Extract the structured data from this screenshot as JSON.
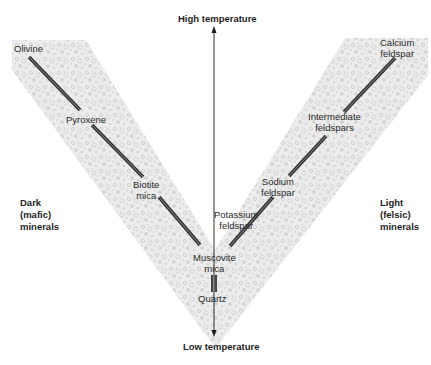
{
  "diagram": {
    "title_top": "High temperature",
    "title_bottom": "Low temperature",
    "left_group": {
      "line1": "Dark",
      "line2": "(mafic)",
      "line3": "minerals"
    },
    "right_group": {
      "line1": "Light",
      "line2": "(felsic)",
      "line3": "minerals"
    },
    "left_series": [
      {
        "label": "Olivine"
      },
      {
        "label": "Pyroxene"
      },
      {
        "label_line1": "Biotite",
        "label_line2": "mica"
      }
    ],
    "right_series": [
      {
        "label_line1": "Calcium",
        "label_line2": "feldspar"
      },
      {
        "label_line1": "Intermediate",
        "label_line2": "feldspars"
      },
      {
        "label_line1": "Sodium",
        "label_line2": "feldspar"
      },
      {
        "label_line1": "Potassium",
        "label_line2": "feldspar"
      }
    ],
    "convergent_series": [
      {
        "label_line1": "Muscovite",
        "label_line2": "mica"
      },
      {
        "label": "Quartz"
      }
    ],
    "colors": {
      "band_fill": "#e6e6e6",
      "band_speckle": "#b5b5b5",
      "mineral_line": "#3a3a3a",
      "mineral_line_highlight": "#8a8a8a",
      "axis": "#1a1a1a",
      "text": "#222222"
    }
  }
}
